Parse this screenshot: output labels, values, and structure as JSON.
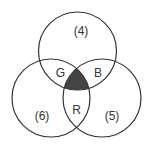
{
  "diagram": {
    "type": "venn",
    "colors": {
      "stroke": "#333333",
      "shaded": "#444444",
      "background": "#ffffff"
    },
    "circles": [
      {
        "id": "top",
        "cx": 77.5,
        "cy": 51,
        "r": 39
      },
      {
        "id": "left",
        "cx": 51,
        "cy": 98,
        "r": 39
      },
      {
        "id": "right",
        "cx": 102,
        "cy": 98,
        "r": 39
      }
    ],
    "labels": {
      "top_only": "(4)",
      "left_only": "(6)",
      "right_only": "(5)",
      "top_left": "G",
      "top_right": "B",
      "left_right": "R"
    },
    "shaded_region": "intersection of all three circles"
  }
}
